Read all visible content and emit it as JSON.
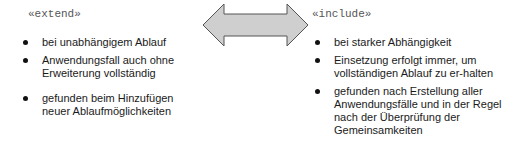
{
  "left": {
    "stereotype": "«extend»",
    "items": [
      "bei unabhängigem Ablauf",
      "Anwendungsfall auch ohne Erweiterung vollständig",
      "gefunden beim Hinzufügen neuer Ablaufmöglichkeiten"
    ]
  },
  "right": {
    "stereotype": "«include»",
    "items": [
      "bei starker Abhängigkeit",
      "Einsetzung erfolgt immer, um vollständigen Ablauf zu er-halten",
      "gefunden nach Erstellung aller Anwendungsfälle und in der Regel nach der Überprüfung der Gemeinsamkeiten"
    ]
  },
  "arrow": {
    "type": "double-headed",
    "fill": "#cccccc",
    "stroke": "#555555"
  }
}
